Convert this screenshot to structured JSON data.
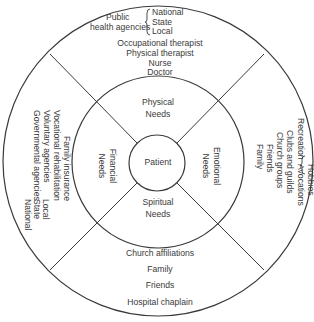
{
  "diagram": {
    "center": "Patient",
    "needs": {
      "physical": [
        "Physical",
        "Needs"
      ],
      "emotional": [
        "Emotional",
        "Needs"
      ],
      "spiritual": [
        "Spiritual",
        "Needs"
      ],
      "financial": [
        "Financial",
        "Needs"
      ]
    },
    "physical_resources": {
      "public_health": {
        "label_line1": "Public",
        "label_line2": "health agencies",
        "levels": [
          "National",
          "State",
          "Local"
        ]
      },
      "items": [
        "Occupational therapist",
        "Physical therapist",
        "Nurse",
        "Doctor"
      ]
    },
    "emotional_resources": {
      "recreation": {
        "label": "Recreation",
        "items": [
          "Hobbies",
          "Avocations"
        ]
      },
      "items": [
        "Clubs and guilds",
        "Church groups",
        "Friends",
        "Family"
      ]
    },
    "spiritual_resources": {
      "items": [
        "Church affiliations",
        "Family",
        "Friends",
        "Hospital chaplain"
      ]
    },
    "financial_resources": {
      "items": [
        "Family insurance",
        "Vocational rehabilitation",
        "Voluntary agencies"
      ],
      "governmental": {
        "label": "Governmental agencies",
        "levels": [
          "Local",
          "State",
          "National"
        ]
      }
    },
    "colors": {
      "line": "#3a3a3a",
      "text": "#3a3a3a",
      "background": "#ffffff"
    }
  }
}
